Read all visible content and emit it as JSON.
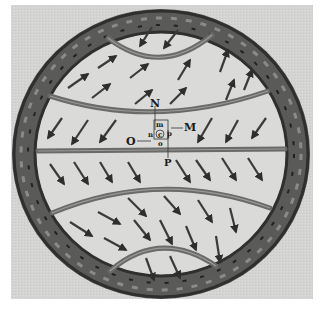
{
  "figure": {
    "labels": {
      "N": "N",
      "M": "M",
      "O": "O",
      "P": "P",
      "m": "m",
      "n": "n",
      "c": "c",
      "p": "p",
      "o": "o"
    },
    "colors": {
      "background": "#d6d6d4",
      "ring": "#4a4a48",
      "band": "#6b6b69",
      "arrow": "#3a3a38"
    },
    "arrow_regions": [
      {
        "region": "top-cap",
        "direction": "down-left"
      },
      {
        "region": "upper",
        "direction": "up-right"
      },
      {
        "region": "upper-middle",
        "direction": "down-left"
      },
      {
        "region": "lower-middle",
        "direction": "down-right"
      },
      {
        "region": "lower",
        "direction": "down-right"
      },
      {
        "region": "bottom-cap",
        "direction": "down-right"
      }
    ]
  }
}
